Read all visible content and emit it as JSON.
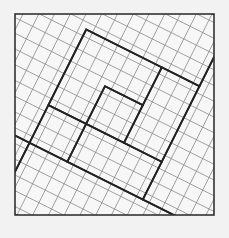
{
  "diagram": {
    "title": "",
    "type": "tilted-grid-square-dissection",
    "colors": {
      "background": "#f2f2f2",
      "paper": "#f7f7f7",
      "thin_line": "#8a8a8a",
      "thick_line": "#222222",
      "frame": "#333333"
    },
    "frame": {
      "x1": 15,
      "y1": 14,
      "x2": 214,
      "y2": 215
    },
    "grid": {
      "origin": [
        114.5,
        114.5
      ],
      "u": [
        12.6,
        6.3
      ],
      "v": [
        -6.3,
        12.6
      ],
      "range": [
        -12,
        12
      ]
    },
    "thick_segments": [
      [
        [
          15,
          14
        ],
        [
          38,
          62
        ]
      ],
      [
        [
          38,
          62
        ],
        [
          92,
          14
        ]
      ],
      [
        [
          92,
          14
        ],
        [
          114,
          62
        ]
      ],
      [
        [
          114,
          62
        ],
        [
          204,
          14
        ]
      ],
      [
        [
          204,
          14
        ],
        [
          214,
          14
        ]
      ],
      [
        [
          214,
          14
        ],
        [
          214,
          20
        ]
      ],
      [
        [
          183,
          41
        ],
        [
          200,
          94
        ]
      ],
      [
        [
          200,
          94
        ],
        [
          214,
          86
        ]
      ],
      [
        [
          80,
          44
        ],
        [
          94,
          74
        ]
      ],
      [
        [
          94,
          74
        ],
        [
          141,
          50
        ]
      ],
      [
        [
          58,
          86
        ],
        [
          70,
          124
        ]
      ],
      [
        [
          70,
          124
        ],
        [
          96,
          109
        ]
      ],
      [
        [
          96,
          109
        ],
        [
          107,
          141
        ]
      ],
      [
        [
          107,
          141
        ],
        [
          143,
          120
        ]
      ],
      [
        [
          143,
          120
        ],
        [
          130,
          91
        ]
      ],
      [
        [
          130,
          91
        ],
        [
          107,
          103
        ]
      ],
      [
        [
          107,
          103
        ],
        [
          96,
          78
        ]
      ],
      [
        [
          96,
          78
        ],
        [
          58,
          86
        ]
      ],
      [
        [
          151,
          97
        ],
        [
          164,
          129
        ]
      ],
      [
        [
          164,
          129
        ],
        [
          117,
          154
        ]
      ],
      [
        [
          117,
          154
        ],
        [
          100,
          170
        ]
      ],
      [
        [
          100,
          170
        ],
        [
          87,
          145
        ]
      ],
      [
        [
          87,
          145
        ],
        [
          58,
          158
        ]
      ],
      [
        [
          58,
          158
        ],
        [
          15,
          180
        ]
      ],
      [
        [
          15,
          140
        ],
        [
          38,
          198
        ]
      ],
      [
        [
          38,
          198
        ],
        [
          15,
          215
        ]
      ],
      [
        [
          15,
          140
        ],
        [
          58,
          121
        ]
      ],
      [
        [
          58,
          121
        ],
        [
          66,
          147
        ]
      ],
      [
        [
          48,
          210
        ],
        [
          91,
          186
        ]
      ],
      [
        [
          91,
          186
        ],
        [
          115,
          174
        ]
      ],
      [
        [
          115,
          174
        ],
        [
          127,
          213
        ]
      ],
      [
        [
          127,
          213
        ],
        [
          200,
          183
        ]
      ],
      [
        [
          200,
          183
        ],
        [
          214,
          215
        ]
      ],
      [
        [
          162,
          173
        ],
        [
          153,
          145
        ]
      ],
      [
        [
          153,
          145
        ],
        [
          185,
          129
        ]
      ],
      [
        [
          185,
          129
        ],
        [
          178,
          104
        ]
      ],
      [
        [
          178,
          104
        ],
        [
          214,
          86
        ]
      ]
    ]
  }
}
